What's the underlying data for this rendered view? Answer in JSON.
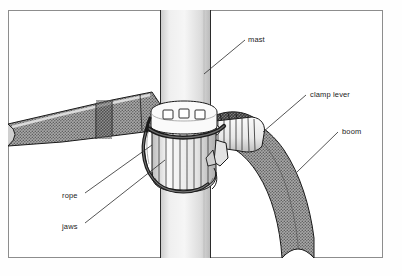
{
  "figure": {
    "frame": {
      "x": 8,
      "y": 10,
      "width": 375,
      "height": 248,
      "stroke": "#8d8d8d"
    },
    "background": "#fefefe",
    "ink": "#1a1a1a"
  },
  "labels": [
    {
      "id": "mast",
      "text": "mast",
      "x": 248,
      "y": 36,
      "leader": {
        "x1": 245,
        "y1": 40,
        "x2": 204,
        "y2": 74
      }
    },
    {
      "id": "clamp-lever",
      "text": "clamp lever",
      "x": 310,
      "y": 91,
      "leader": {
        "x1": 306,
        "y1": 95,
        "x2": 263,
        "y2": 132
      }
    },
    {
      "id": "boom",
      "text": "boom",
      "x": 342,
      "y": 128,
      "leader": {
        "x1": 338,
        "y1": 132,
        "x2": 297,
        "y2": 172
      }
    },
    {
      "id": "rope",
      "text": "rope",
      "x": 62,
      "y": 192,
      "leader": {
        "x1": 85,
        "y1": 193,
        "x2": 152,
        "y2": 145
      }
    },
    {
      "id": "jaws",
      "text": "jaws",
      "x": 62,
      "y": 223,
      "leader": {
        "x1": 85,
        "y1": 223,
        "x2": 165,
        "y2": 160
      }
    }
  ],
  "parts": {
    "mast": {
      "kind": "vertical-cylinder",
      "x_left": 160,
      "x_right": 211,
      "shading": "light-gradient"
    },
    "boom": {
      "kind": "curved-tube",
      "direction": "down-right",
      "texture": "cross-hatch-gray"
    },
    "left_arm": {
      "kind": "tapered-tube",
      "direction": "up-right",
      "texture": "cross-hatch-gray"
    },
    "collar": {
      "kind": "fluted-clamp-collar",
      "slots": 3,
      "flutes": 8
    },
    "clamp_lever": {
      "kind": "ribbed-handle",
      "direction": "right"
    },
    "rope": {
      "kind": "dark-cord-loop"
    }
  },
  "colors": {
    "tube_dark": "#6f6f6f",
    "tube_mid": "#9a9a9a",
    "tube_light": "#d6d6d6",
    "metal_light": "#f2f2f2",
    "metal_shade": "#c2c2c2",
    "rope_dark": "#2a2a2a",
    "mast_light": "#f0f0f0",
    "mast_shade": "#cfcfcf"
  }
}
